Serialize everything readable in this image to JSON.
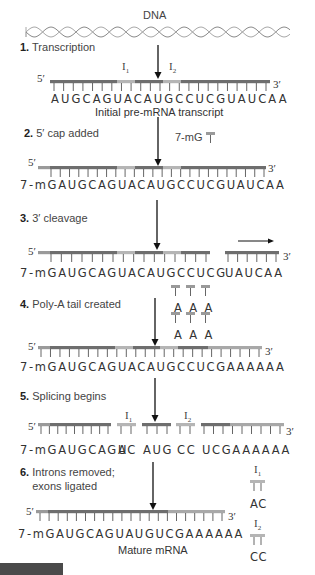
{
  "title": "DNA",
  "colors": {
    "exon_dark": "#6e6e6e",
    "intron_light": "#b5b5b5",
    "cap_light": "#9a9a9a",
    "polyA_light": "#a8a8a8",
    "text": "#333333"
  },
  "steps": [
    {
      "number": "1.",
      "label": "Transcription",
      "sequence": "AUGCAGUACAUGCCUCGUAUCAA",
      "caption": "Initial pre-mRNA transcript",
      "introns": [
        "I1",
        "I2"
      ]
    },
    {
      "number": "2.",
      "label": "5′ cap added",
      "cap_label": "7-mG",
      "sequence": "7-mGAUGCAGUACAUGCCUCGUAUCAA"
    },
    {
      "number": "3.",
      "label": "3′ cleavage",
      "sequence": "7-mGAUGCAGUACAUGCCUCG",
      "cleaved_fragment": "UAUCAA"
    },
    {
      "number": "4.",
      "label": "Poly-A tail created",
      "added_bases": [
        "A",
        "A",
        "A",
        "A",
        "A",
        "A"
      ],
      "sequence": "7-mGAUGCAGUACAUGCCUCGAAAAAA"
    },
    {
      "number": "5.",
      "label": "Splicing begins",
      "segments": [
        "7-mGAUGCAGU",
        "AC",
        "AUG",
        "CC",
        "UCGAAAAAA"
      ],
      "introns": [
        "I1",
        "I2"
      ]
    },
    {
      "number": "6.",
      "label_line1": "Introns removed;",
      "label_line2": "exons ligated",
      "sequence": "7-mGAUGCAGUAUGUCGAAAAAA",
      "caption": "Mature mRNA",
      "removed_introns": [
        {
          "name": "I1",
          "seq": "AC"
        },
        {
          "name": "I2",
          "seq": "CC"
        }
      ]
    }
  ],
  "ends": {
    "five": "5′",
    "three": "3′"
  }
}
